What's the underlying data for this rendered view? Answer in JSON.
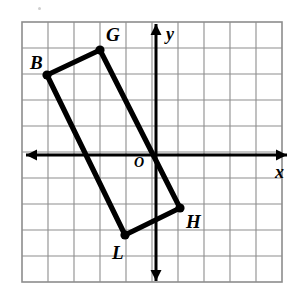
{
  "figure": {
    "kind": "coordinate-plane-quadrilateral",
    "background_color": "#ffffff",
    "grid_color": "#8d8d8d",
    "axis_color": "#000000",
    "shape_color": "#000000"
  },
  "grid": {
    "left": 22,
    "top": 22,
    "right": 282,
    "bottom": 282,
    "cell_size": 26,
    "columns": 10,
    "rows": 10
  },
  "axes": {
    "origin_px": {
      "x": 156,
      "y": 155
    },
    "x_axis": {
      "label": "x",
      "label_px": {
        "x": 275,
        "y": 163
      },
      "from_px": {
        "x": 26,
        "y": 155
      },
      "to_px": {
        "x": 287,
        "y": 155
      },
      "arrow_both_ends": true
    },
    "y_axis": {
      "label": "y",
      "label_px": {
        "x": 166,
        "y": 25
      },
      "from_px": {
        "x": 156,
        "y": 24
      },
      "to_px": {
        "x": 156,
        "y": 281
      },
      "arrow_both_ends": true
    },
    "origin_label": "O",
    "origin_label_px": {
      "x": 134,
      "y": 156
    }
  },
  "chart_data": {
    "type": "scatter",
    "title": "",
    "xlabel": "x",
    "ylabel": "y",
    "grid": true,
    "xlim": [
      -6,
      5
    ],
    "ylim": [
      -5,
      5
    ],
    "points": [
      {
        "name": "B",
        "x": -4,
        "y": 3,
        "px": 47,
        "py": 75,
        "label_px": {
          "x": 30,
          "y": 53
        }
      },
      {
        "name": "G",
        "x": -2,
        "y": 4,
        "px": 100,
        "py": 50,
        "label_px": {
          "x": 106,
          "y": 25
        }
      },
      {
        "name": "H",
        "x": 1,
        "y": -2,
        "px": 180,
        "py": 208,
        "label_px": {
          "x": 186,
          "y": 212
        }
      },
      {
        "name": "L",
        "x": -1,
        "y": -3,
        "px": 125,
        "py": 235,
        "label_px": {
          "x": 112,
          "y": 243
        }
      }
    ],
    "polygon_order": [
      "B",
      "G",
      "H",
      "L"
    ],
    "edges": [
      {
        "from": "B",
        "to": "G"
      },
      {
        "from": "G",
        "to": "H"
      },
      {
        "from": "H",
        "to": "L"
      },
      {
        "from": "L",
        "to": "B"
      }
    ]
  },
  "marks": {
    "speck": {
      "px": 38,
      "py": 7,
      "w": 3,
      "h": 3
    }
  }
}
